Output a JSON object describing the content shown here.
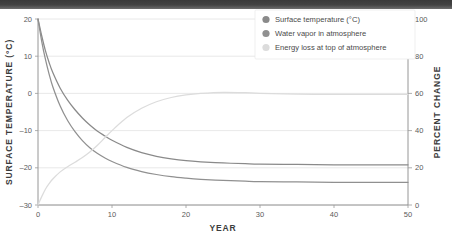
{
  "chart_data": {
    "type": "line",
    "title": "",
    "xlabel": "YEAR",
    "ylabel": "SURFACE TEMPERATURE (°C)",
    "y2label": "PERCENT CHANGE",
    "xlim": [
      0,
      50
    ],
    "ylim": [
      -30,
      20
    ],
    "y2lim": [
      0,
      100
    ],
    "xticks": [
      0,
      10,
      20,
      30,
      40,
      50
    ],
    "yticks": [
      20,
      10,
      0,
      -10,
      -20,
      -30
    ],
    "y2ticks": [
      100,
      80,
      60,
      40,
      20,
      0
    ],
    "grid": true,
    "legend_position": "top-right",
    "x": [
      0,
      0.5,
      1,
      1.5,
      2,
      3,
      4,
      5,
      6,
      7,
      8,
      9,
      10,
      12,
      14,
      16,
      18,
      20,
      22,
      25,
      28,
      30,
      35,
      40,
      45,
      50
    ],
    "series": [
      {
        "name": "Surface temperature (°C)",
        "color": "#8a8a8a",
        "axis": "left",
        "values": [
          20,
          15.5,
          11.5,
          8.3,
          5.6,
          1.4,
          -1.8,
          -4.4,
          -6.6,
          -8.5,
          -10.1,
          -11.4,
          -12.6,
          -14.5,
          -15.9,
          -16.9,
          -17.6,
          -18.1,
          -18.4,
          -18.7,
          -18.9,
          -19.0,
          -19.1,
          -19.2,
          -19.2,
          -19.2
        ]
      },
      {
        "name": "Water vapor in atmosphere",
        "color": "#909090",
        "axis": "left",
        "values": [
          20,
          14.0,
          9.2,
          5.2,
          1.8,
          -3.4,
          -7.3,
          -10.3,
          -12.7,
          -14.6,
          -16.1,
          -17.3,
          -18.3,
          -19.9,
          -21.0,
          -21.8,
          -22.4,
          -22.8,
          -23.1,
          -23.4,
          -23.6,
          -23.7,
          -23.8,
          -23.9,
          -23.9,
          -23.9
        ]
      },
      {
        "name": "Energy loss at top of atmosphere",
        "color": "#dcdcdc",
        "axis": "right",
        "values": [
          0,
          4.5,
          8.5,
          11.5,
          14.0,
          17.8,
          20.6,
          23.0,
          25.5,
          28.5,
          32.0,
          36.0,
          40.0,
          47.0,
          52.0,
          55.5,
          57.8,
          59.2,
          60.0,
          60.6,
          60.4,
          60.0,
          59.6,
          59.5,
          59.5,
          59.5
        ]
      }
    ]
  },
  "legend": {
    "items": [
      {
        "label": "Surface temperature (°C)",
        "color": "#8a8a8a"
      },
      {
        "label": "Water vapor in atmosphere",
        "color": "#909090"
      },
      {
        "label": "Energy loss at top of atmosphere",
        "color": "#dcdcdc"
      }
    ]
  },
  "axes": {
    "x_title": "YEAR",
    "y_left_title": "SURFACE TEMPERATURE (°C)",
    "y_right_title": "PERCENT CHANGE",
    "x_ticks": [
      "0",
      "10",
      "20",
      "30",
      "40",
      "50"
    ],
    "y_left_ticks": [
      "20",
      "10",
      "0",
      "–10",
      "–20",
      "–30"
    ],
    "y_right_ticks": [
      "100",
      "80",
      "60",
      "40",
      "20",
      "0"
    ]
  }
}
